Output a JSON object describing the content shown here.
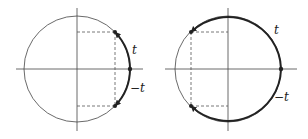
{
  "diagrams": [
    {
      "id": "left",
      "description": "Unit circle with short arcs of length t and -t from (1,0)",
      "labels": {
        "t": "t",
        "neg_t": "−t"
      }
    },
    {
      "id": "right",
      "description": "Unit circle with long arcs of length t and -t from (1,0) reaching second and third quadrants",
      "labels": {
        "t": "t",
        "neg_t": "−t"
      }
    }
  ],
  "colors": {
    "line": "#333333",
    "dashed": "#555555",
    "background": "#ffffff"
  }
}
